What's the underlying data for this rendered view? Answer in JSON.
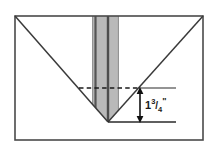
{
  "figure": {
    "type": "technical-line-drawing",
    "canvas": {
      "width": 217,
      "height": 145,
      "background": "#ffffff"
    }
  },
  "colors": {
    "outline": "#3a3a3a",
    "frame_border": "#4a4a4a",
    "band_fill": "#b9b9b9",
    "band_edge": "#555555",
    "band_center_line": "#4d4d4d",
    "dashed_line": "#1a1a1a",
    "dimension_line": "#111111",
    "label_text": "#1a1a1a",
    "background": "#ffffff"
  },
  "elements": {
    "workpiece_frame": {
      "name": "rectangular stock outline",
      "x": 15,
      "y": 16,
      "width": 188,
      "height": 124
    },
    "v_notch": {
      "name": "V groove",
      "left_start": {
        "x": 15,
        "y": 16
      },
      "apex": {
        "x": 108,
        "y": 122
      },
      "right_end": {
        "x": 203,
        "y": 16
      }
    },
    "cutter_band": {
      "name": "vertical shaded blade band",
      "left": 92,
      "right": 119,
      "top": 16,
      "center_x": 108
    },
    "reference_line": {
      "name": "dashed reference line",
      "y": 88,
      "x_start": 79,
      "x_end": 140,
      "style": "dashed"
    },
    "extension_line_upper": {
      "name": "upper extension line",
      "y": 88,
      "x_start": 140,
      "x_end": 176
    },
    "extension_line_lower": {
      "name": "lower extension line",
      "y": 122,
      "x_start": 108,
      "x_end": 176
    },
    "dimension_arrow": {
      "name": "vertical double-headed dimension arrow",
      "x": 140,
      "y_top": 88,
      "y_bottom": 122
    }
  },
  "labels": {
    "depth_dimension": {
      "whole": "1",
      "numerator": "3",
      "slash": "/",
      "denominator": "4",
      "unit": "\"",
      "full_text": "1 3/4\""
    }
  }
}
